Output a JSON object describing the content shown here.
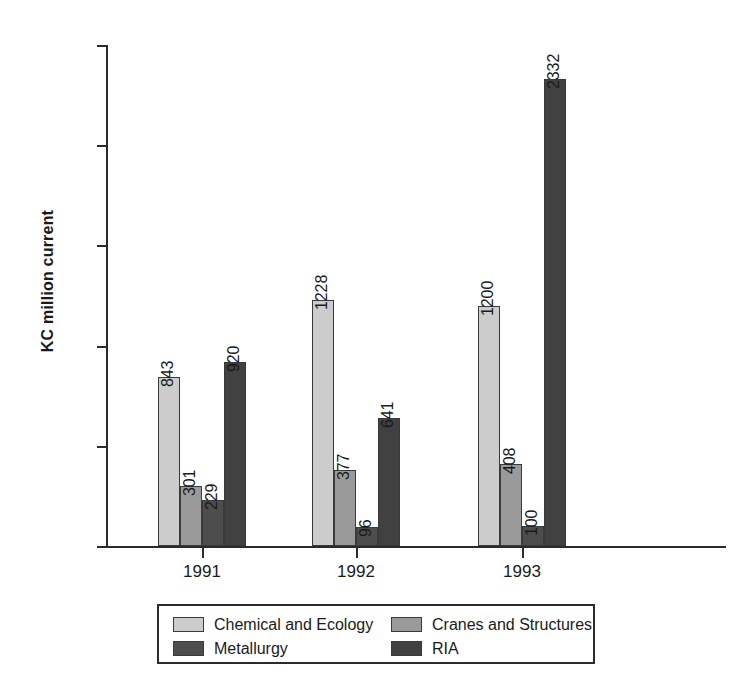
{
  "chart_data": {
    "type": "bar",
    "title": "",
    "xlabel": "",
    "ylabel": "KC million current",
    "categories": [
      "1991",
      "1992",
      "1993"
    ],
    "ylim": [
      0,
      2500
    ],
    "ytick_values": [
      0,
      500,
      1000,
      1500,
      2000,
      2500
    ],
    "ytick_labels": [
      "0",
      "500",
      "1000",
      "1500",
      "2000",
      "2500"
    ],
    "grid": false,
    "legend_position": "bottom",
    "series": [
      {
        "name": "Chemical and Ecology",
        "color": "#cccccc",
        "values": [
          843,
          1228,
          1200
        ]
      },
      {
        "name": "Cranes and Structures",
        "color": "#9a9a9a",
        "values": [
          301,
          377,
          408
        ]
      },
      {
        "name": "Metallurgy",
        "color": "#4d4d4d",
        "values": [
          229,
          96,
          100
        ]
      },
      {
        "name": "RIA",
        "color": "#414141",
        "values": [
          920,
          641,
          2332
        ]
      }
    ]
  },
  "axis": {
    "y_title": "KC million current"
  },
  "legend": {
    "entries": [
      {
        "label": "Chemical and Ecology",
        "color": "#cccccc"
      },
      {
        "label": "Cranes and Structures",
        "color": "#9a9a9a"
      },
      {
        "label": "Metallurgy",
        "color": "#4d4d4d"
      },
      {
        "label": "RIA",
        "color": "#414141"
      }
    ]
  }
}
